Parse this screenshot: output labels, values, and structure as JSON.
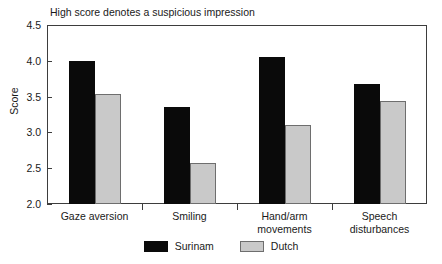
{
  "chart_data": {
    "type": "bar",
    "title": "High score denotes a suspicious impression",
    "xlabel": "",
    "ylabel": "Score",
    "ylim": [
      2.0,
      4.5
    ],
    "yticks": [
      "2.0",
      "2.5",
      "3.0",
      "3.5",
      "4.0",
      "4.5"
    ],
    "grid": false,
    "legend_position": "bottom-center",
    "categories": [
      "Gaze aversion",
      "Smiling",
      "Hand/arm movements",
      "Speech disturbances"
    ],
    "category_lines": [
      [
        "Gaze aversion"
      ],
      [
        "Smiling"
      ],
      [
        "Hand/arm",
        "movements"
      ],
      [
        "Speech",
        "disturbances"
      ]
    ],
    "series": [
      {
        "name": "Surinam",
        "color": "#0a0a0a",
        "values": [
          4.0,
          3.35,
          4.05,
          3.68
        ]
      },
      {
        "name": "Dutch",
        "color": "#c9c9c9",
        "values": [
          3.53,
          2.57,
          3.1,
          3.44
        ]
      }
    ]
  }
}
